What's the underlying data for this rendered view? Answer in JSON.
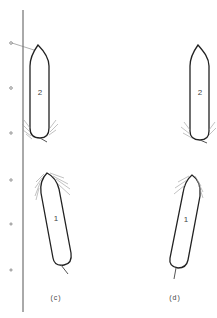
{
  "figure": {
    "panels": [
      {
        "id": "c",
        "label": "(c)",
        "has_quay": true,
        "ships": [
          {
            "number": "2",
            "orientation": "vertical",
            "position": "upper"
          },
          {
            "number": "1",
            "orientation": "tilted",
            "position": "lower"
          }
        ]
      },
      {
        "id": "d",
        "label": "(d)",
        "has_quay": false,
        "ships": [
          {
            "number": "2",
            "orientation": "vertical",
            "position": "upper"
          },
          {
            "number": "1",
            "orientation": "tilted",
            "position": "lower"
          }
        ]
      }
    ],
    "bollards_count": 6,
    "colors": {
      "line": "#222222",
      "wake": "#999999",
      "background": "#ffffff"
    }
  }
}
